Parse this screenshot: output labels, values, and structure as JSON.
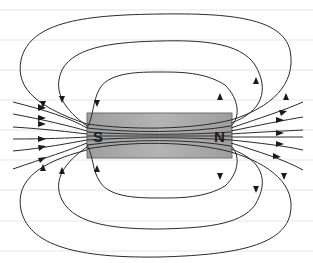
{
  "diagram": {
    "magnet": {
      "south_label": "S",
      "north_label": "N",
      "fill_color": "#a9a9a9",
      "border_color": "#6e6e6e"
    },
    "background": {
      "ruled_lines": true,
      "line_color": "#e6e6e6"
    },
    "field_line_color": "#2a2a2a"
  }
}
